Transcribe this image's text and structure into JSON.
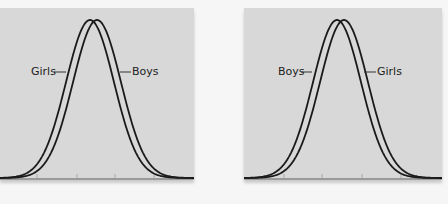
{
  "chart_data": [
    {
      "type": "line",
      "title": "",
      "xlabel": "",
      "ylabel": "",
      "grid": false,
      "panel": {
        "x": 0,
        "y": 8,
        "width": 194,
        "height": 172
      },
      "baseline_y": 170,
      "peak_y": 12,
      "x_ticks_px": [
        37,
        77,
        115,
        154
      ],
      "series": [
        {
          "name": "Girls",
          "center_px": 90,
          "sigma_px": 24,
          "label_side": "left"
        },
        {
          "name": "Boys",
          "center_px": 97,
          "sigma_px": 24,
          "label_side": "right"
        }
      ],
      "annotations": [
        {
          "text": "Girls",
          "x": 31,
          "y": 58,
          "line_from": 54,
          "line_to": 66
        },
        {
          "text": "Boys",
          "x": 132,
          "y": 58,
          "line_from": 120,
          "line_to": 131
        }
      ]
    },
    {
      "type": "line",
      "title": "",
      "xlabel": "",
      "ylabel": "",
      "grid": false,
      "panel": {
        "x": 244,
        "y": 8,
        "width": 198,
        "height": 172
      },
      "baseline_y": 170,
      "peak_y": 12,
      "x_ticks_px": [
        40,
        78,
        118,
        157
      ],
      "series": [
        {
          "name": "Boys",
          "center_px": 93,
          "sigma_px": 24,
          "label_side": "left"
        },
        {
          "name": "Girls",
          "center_px": 100,
          "sigma_px": 24,
          "label_side": "right"
        }
      ],
      "annotations": [
        {
          "text": "Boys",
          "x": 34,
          "y": 58,
          "line_from": 57,
          "line_to": 68
        },
        {
          "text": "Girls",
          "x": 133,
          "y": 58,
          "line_from": 120,
          "line_to": 132
        }
      ]
    }
  ],
  "colors": {
    "panel_bg": "#d8d8d8",
    "curve": "#1a1a1a",
    "page_bg": "#f6f6f6"
  }
}
